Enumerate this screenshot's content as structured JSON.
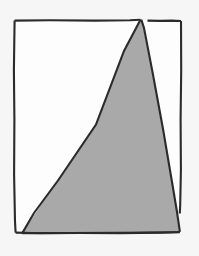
{
  "figure": {
    "title": "Triangle inscribed in rectangle",
    "style": "hand-drawn line art",
    "background_color": "#f6f6f6",
    "ink_color": "#2b2b2b",
    "fill_color": "#a9a9a9",
    "interior_color": "#fdfdfd",
    "stroke_width": 2,
    "canvas": {
      "width": 199,
      "height": 256
    },
    "shapes": [
      {
        "name": "rectangle",
        "type": "quadrilateral",
        "filled": false,
        "fill_color": "#fdfdfd",
        "stroke_color": "#2b2b2b",
        "vertices": [
          [
            14,
            20
          ],
          [
            181,
            21
          ],
          [
            180,
            212
          ],
          [
            16,
            233
          ]
        ],
        "note": "outer frame, drawn freehand so edges are slightly irregular; right edge terminates where the triangle edge crosses it"
      },
      {
        "name": "triangle",
        "type": "triangle",
        "filled": true,
        "fill_color": "#a9a9a9",
        "stroke_color": "#2b2b2b",
        "vertices": [
          [
            141,
            19
          ],
          [
            180,
            232
          ],
          [
            22,
            233
          ]
        ],
        "note": "apex touches the top edge of the rectangle near its right side; base runs along the bottom edge"
      }
    ],
    "gaps": [
      {
        "name": "left-sliver",
        "description": "narrow white wedge between the rectangle left-bottom corner and the triangle's left edge"
      },
      {
        "name": "right-sliver",
        "description": "narrow white wedge between the triangle's right edge and the rectangle's right edge, converging near the bottom"
      }
    ]
  }
}
